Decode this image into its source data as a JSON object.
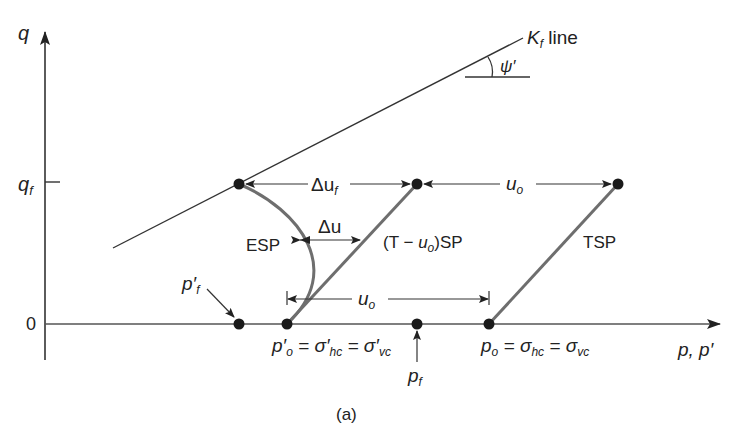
{
  "figure": {
    "caption": "(a)",
    "axes": {
      "y_label": "q",
      "x_label": "p, p′",
      "y_tick_qf": "q",
      "y_tick_qf_sub": "f",
      "y_tick_zero": "0"
    },
    "kf_line": {
      "label_main": "K",
      "label_sub": "f",
      "label_suffix": " line",
      "angle_label": "ψ′"
    },
    "paths": {
      "esp": "ESP",
      "tsp": "TSP",
      "t_uo_sp_prefix": "(T − ",
      "t_uo_sp_u": "u",
      "t_uo_sp_sub": "o",
      "t_uo_sp_suffix": ")SP"
    },
    "dimensions": {
      "delta_uf_main": "Δu",
      "delta_uf_sub": "f",
      "delta_u": "Δu",
      "uo_top_main": "u",
      "uo_top_sub": "o",
      "uo_bottom_main": "u",
      "uo_bottom_sub": "o"
    },
    "points": {
      "pf_prime_main": "p′",
      "pf_prime_sub": "f",
      "po_prime_main": "p′",
      "po_prime_sub": "o",
      "po_prime_eq1": " = σ′",
      "po_prime_eq1_sub": "hc",
      "po_prime_eq2": " = σ′",
      "po_prime_eq2_sub": "vc",
      "pf_main": "p",
      "pf_sub": "f",
      "po_main": "p",
      "po_sub": "o",
      "po_eq1": " = σ",
      "po_eq1_sub": "hc",
      "po_eq2": " = σ",
      "po_eq2_sub": "vc"
    },
    "colors": {
      "axis": "#333333",
      "stress_path": "#6e6e6e",
      "dot": "#1a1a1a",
      "text": "#222222"
    }
  }
}
